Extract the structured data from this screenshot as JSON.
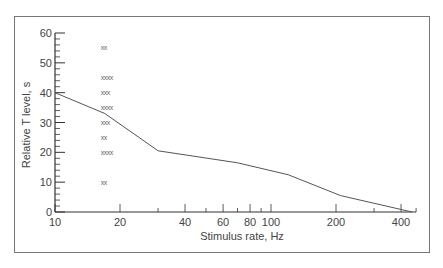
{
  "chart_data": {
    "type": "line",
    "title": "",
    "xlabel": "Stimulus rate, Hz",
    "ylabel": "Relative T level, s",
    "xscale": "log",
    "xlim": [
      10,
      450
    ],
    "ylim": [
      0,
      60
    ],
    "x_ticks": [
      10,
      20,
      40,
      60,
      80,
      100,
      200,
      400
    ],
    "x_tick_labels": [
      "10",
      "20",
      "40",
      "60",
      "80",
      "100",
      "200",
      "400"
    ],
    "x_minor_ticks": [
      30,
      50,
      70,
      90,
      300
    ],
    "y_ticks": [
      0,
      10,
      20,
      30,
      40,
      50,
      60
    ],
    "y_tick_labels": [
      "0",
      "10",
      "20",
      "30",
      "40",
      "50",
      "60"
    ],
    "grid": false,
    "legend": null,
    "series": [
      {
        "name": "curve",
        "style": "line",
        "x": [
          10,
          17,
          30,
          70,
          120,
          210,
          450
        ],
        "y": [
          40,
          33,
          20.5,
          16.5,
          12.5,
          5.5,
          0
        ]
      },
      {
        "name": "individual data (x markers)",
        "style": "marker",
        "marker_text": [
          "xx",
          "xxxx",
          "xxx",
          "xxxx",
          "xxx",
          "xx",
          "xxxx",
          "xx"
        ],
        "x": [
          17,
          17,
          17,
          17,
          17,
          17,
          17,
          17
        ],
        "y": [
          55,
          45,
          40,
          35,
          30,
          25,
          20,
          10
        ]
      }
    ]
  }
}
